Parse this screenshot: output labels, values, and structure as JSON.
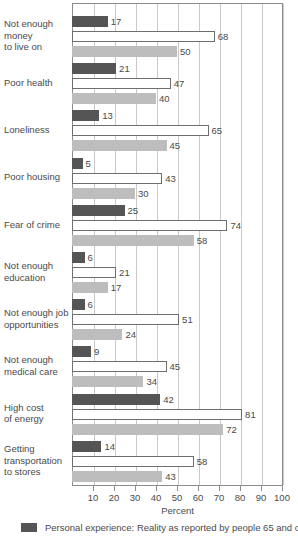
{
  "chart_data": {
    "type": "bar",
    "orientation": "horizontal",
    "title": "",
    "xlabel": "Percent",
    "ylabel": "",
    "xlim": [
      0,
      100
    ],
    "xticks": [
      10,
      20,
      30,
      40,
      50,
      60,
      70,
      80,
      90,
      100
    ],
    "grid": true,
    "legend_position": "bottom",
    "categories": [
      "Not enough\nmoney\nto live on",
      "Poor health",
      "Loneliness",
      "Poor housing",
      "Fear of crime",
      "Not enough\neducation",
      "Not enough job\nopportunities",
      "Not enough\nmedical care",
      "High cost\nof energy",
      "Getting\ntransportation\nto stores"
    ],
    "series": [
      {
        "name": "Personal experience: Reality as reported by people 65 and over",
        "color": "#555555",
        "values": [
          17,
          21,
          13,
          5,
          25,
          6,
          6,
          9,
          42,
          14
        ]
      },
      {
        "name": "series-2",
        "color": "#ffffff",
        "values": [
          68,
          47,
          65,
          43,
          74,
          21,
          51,
          45,
          81,
          58
        ]
      },
      {
        "name": "series-3",
        "color": "#bdbdbd",
        "values": [
          50,
          40,
          45,
          30,
          58,
          17,
          24,
          34,
          72,
          43
        ]
      }
    ]
  },
  "axis": {
    "x_title": "Percent",
    "tick_labels": [
      "10",
      "20",
      "30",
      "40",
      "50",
      "60",
      "70",
      "80",
      "90",
      "100"
    ]
  },
  "legend": {
    "entries": [
      {
        "swatch_color": "#555555",
        "label": "Personal experience: Reality as reported by people 65 and over"
      }
    ]
  },
  "category_labels": [
    {
      "lines": [
        "Not enough",
        "money",
        "to live on"
      ]
    },
    {
      "lines": [
        "Poor health"
      ]
    },
    {
      "lines": [
        "Loneliness"
      ]
    },
    {
      "lines": [
        "Poor housing"
      ]
    },
    {
      "lines": [
        "Fear of crime"
      ]
    },
    {
      "lines": [
        "Not enough",
        "education"
      ]
    },
    {
      "lines": [
        "Not enough job",
        "opportunities"
      ]
    },
    {
      "lines": [
        "Not enough",
        "medical care"
      ]
    },
    {
      "lines": [
        "High cost",
        "of energy"
      ]
    },
    {
      "lines": [
        "Getting",
        "transportation",
        "to stores"
      ]
    }
  ],
  "colors": {
    "series_dark": "#555555",
    "series_white": "#ffffff",
    "series_gray": "#bdbdbd",
    "grid": "#c9c9c9",
    "frame": "#8c8c8c",
    "text": "#4a4a4a"
  }
}
